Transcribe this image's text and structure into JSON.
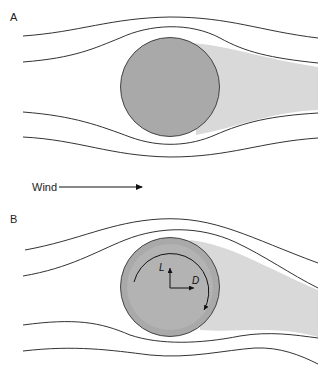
{
  "panels": [
    {
      "label": "A",
      "description": "Non-rotating sphere in airflow with symmetric wake"
    },
    {
      "label": "B",
      "description": "Rotating sphere with deflected wake, lift and drag vectors"
    }
  ],
  "wind": {
    "label": "Wind"
  },
  "forces": {
    "lift": "L",
    "drag": "D"
  },
  "colors": {
    "sphere_fill": "#a9a9a9",
    "sphere_inner": "#b3b3b3",
    "wake": "#d9d9d9",
    "line": "#333333"
  }
}
